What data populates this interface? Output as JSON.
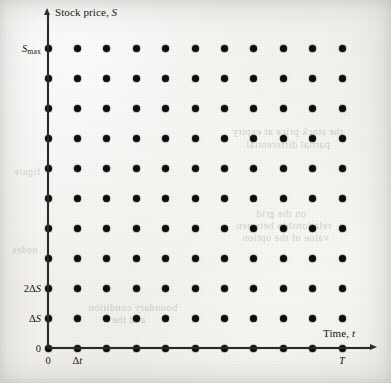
{
  "figure": {
    "type": "finite-difference-grid",
    "background_color": "#f1f0ec",
    "dot_color": "#0d0d0d",
    "axis_color": "#2a2a2a"
  },
  "axes": {
    "y": {
      "title_text": "Stock price,",
      "title_symbol": "S",
      "labels": [
        {
          "id": "y-zero",
          "text": "0",
          "symbol": "",
          "sub": "",
          "row": 0
        },
        {
          "id": "y-ds",
          "text": "",
          "symbol": "ΔS",
          "sub": "",
          "row": 1
        },
        {
          "id": "y-2ds",
          "text": "2",
          "symbol": "ΔS",
          "sub": "",
          "row": 2
        },
        {
          "id": "y-smax",
          "text": "",
          "symbol": "S",
          "sub": "max",
          "row": 10
        }
      ]
    },
    "x": {
      "title_text": "Time,",
      "title_symbol": "t",
      "labels": [
        {
          "id": "x-zero",
          "text": "0",
          "symbol": "",
          "col": 0
        },
        {
          "id": "x-dt",
          "text": "",
          "symbol": "Δt",
          "col": 1
        },
        {
          "id": "x-T",
          "text": "",
          "symbol": "T",
          "col": 10
        }
      ]
    }
  },
  "chart_data": {
    "type": "scatter",
    "title": "",
    "xlabel": "Time, t",
    "ylabel": "Stock price, S",
    "grid": false,
    "legend": null,
    "n_cols": 11,
    "n_rows": 11,
    "xlim": [
      0,
      10
    ],
    "ylim": [
      0,
      10
    ],
    "xtick_values": [
      0,
      1,
      10
    ],
    "xtick_labels": [
      "0",
      "Δt",
      "T"
    ],
    "ytick_values": [
      0,
      1,
      2,
      10
    ],
    "ytick_labels": [
      "0",
      "ΔS",
      "2ΔS",
      "S_max"
    ],
    "x": [
      0,
      1,
      2,
      3,
      4,
      5,
      6,
      7,
      8,
      9,
      10
    ],
    "y": [
      0,
      1,
      2,
      3,
      4,
      5,
      6,
      7,
      8,
      9,
      10
    ],
    "points_note": "every (x_i, y_j) pair for i,j = 0..10 is plotted as a filled black dot"
  },
  "layout": {
    "origin_x": 48,
    "origin_y": 348,
    "step_x": 29.4,
    "step_y": 30.0
  },
  "showthrough": [
    {
      "id": "st-1",
      "text": "the stock price at expiry",
      "x": 232,
      "y": 126,
      "size": 10.5
    },
    {
      "id": "st-2",
      "text": "partial differential",
      "x": 246,
      "y": 139,
      "size": 10.5
    },
    {
      "id": "st-3",
      "text": "on the grid",
      "x": 256,
      "y": 208,
      "size": 10.5
    },
    {
      "id": "st-4",
      "text": "relationship between",
      "x": 236,
      "y": 220,
      "size": 10.5
    },
    {
      "id": "st-5",
      "text": "value of the option",
      "x": 242,
      "y": 232,
      "size": 10.5
    },
    {
      "id": "st-6",
      "text": "boundary condition",
      "x": 88,
      "y": 302,
      "size": 10.5
    },
    {
      "id": "st-7",
      "text": "and the",
      "x": 112,
      "y": 314,
      "size": 10.5
    },
    {
      "id": "st-8",
      "text": "figure",
      "x": 14,
      "y": 166,
      "size": 10
    },
    {
      "id": "st-9",
      "text": "nodes",
      "x": 12,
      "y": 244,
      "size": 10
    }
  ]
}
